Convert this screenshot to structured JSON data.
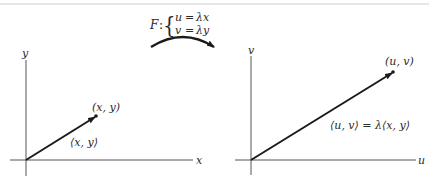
{
  "mapping": {
    "name": "F",
    "colon": ":",
    "brace": "{",
    "eq1": {
      "lhs": "u",
      "op": "=",
      "rhs": "λx"
    },
    "eq2": {
      "lhs": "v",
      "op": "=",
      "rhs": "λy"
    }
  },
  "left_plot": {
    "x_axis_label": "x",
    "y_axis_label": "y",
    "point_label": "(x, y)",
    "vector_label": "⟨x, y⟩"
  },
  "right_plot": {
    "x_axis_label": "u",
    "y_axis_label": "v",
    "point_label": "(u, v)",
    "vector_label": "⟨u, v⟩ = λ⟨x, y⟩"
  },
  "colors": {
    "ink": "#2a2a2a",
    "axis": "#555555",
    "top_rule": "#e6e6e6"
  }
}
